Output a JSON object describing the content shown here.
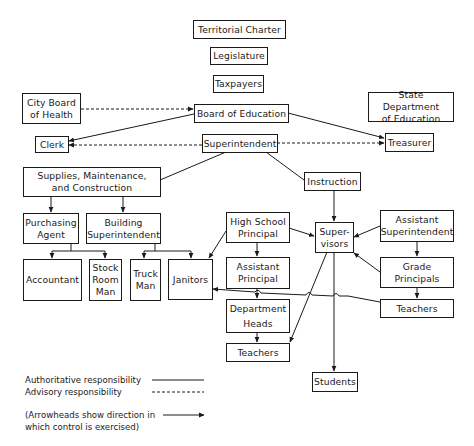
{
  "diagram": {
    "type": "organizational-chart",
    "nodes": {
      "territorial_charter": "Territorial Charter",
      "legislature": "Legislature",
      "taxpayers": "Taxpayers",
      "city_board_of_health": "City Board\nof Health",
      "board_of_education": "Board of Education",
      "state_department_of_education": "State Department\nof Education",
      "clerk": "Clerk",
      "superintendent": "Superintendent",
      "treasurer": "Treasurer",
      "supplies": "Supplies, Maintenance,\nand Construction",
      "instruction": "Instruction",
      "purchasing_agent": "Purchasing\nAgent",
      "building_superintendent": "Building\nSuperintendent",
      "high_school_principal": "High School\nPrincipal",
      "supervisors": "Super-\nvisors",
      "assistant_superintendent": "Assistant\nSuperintendent",
      "accountant": "Accountant",
      "stock_room_man": "Stock\nRoom\nMan",
      "truck_man": "Truck\nMan",
      "janitors": "Janitors",
      "assistant_principal": "Assistant\nPrincipal",
      "grade_principals": "Grade\nPrincipals",
      "department_heads": "Department\nHeads",
      "teachers_elementary": "Teachers",
      "teachers_high_school": "Teachers",
      "students": "Students"
    },
    "edges": [
      {
        "from": "city_board_of_health",
        "to": "board_of_education",
        "style": "advisory"
      },
      {
        "from": "board_of_education",
        "to": "clerk",
        "style": "authoritative"
      },
      {
        "from": "board_of_education",
        "to": "treasurer",
        "style": "authoritative"
      },
      {
        "from": "superintendent",
        "to": "clerk",
        "style": "advisory"
      },
      {
        "from": "superintendent",
        "to": "treasurer",
        "style": "advisory"
      },
      {
        "from": "superintendent",
        "to": "supplies",
        "style": "authoritative"
      },
      {
        "from": "superintendent",
        "to": "instruction",
        "style": "authoritative"
      },
      {
        "from": "supplies",
        "to": "purchasing_agent",
        "style": "authoritative"
      },
      {
        "from": "supplies",
        "to": "building_superintendent",
        "style": "authoritative"
      },
      {
        "from": "purchasing_agent",
        "to": "accountant",
        "style": "authoritative"
      },
      {
        "from": "purchasing_agent",
        "to": "stock_room_man",
        "style": "authoritative"
      },
      {
        "from": "building_superintendent",
        "to": "truck_man",
        "style": "authoritative"
      },
      {
        "from": "building_superintendent",
        "to": "janitors",
        "style": "authoritative"
      },
      {
        "from": "high_school_principal",
        "to": "janitors",
        "style": "authoritative"
      },
      {
        "from": "high_school_principal",
        "to": "supervisors",
        "style": "authoritative"
      },
      {
        "from": "high_school_principal",
        "to": "assistant_principal",
        "style": "authoritative"
      },
      {
        "from": "instruction",
        "to": "supervisors",
        "style": "authoritative"
      },
      {
        "from": "assistant_superintendent",
        "to": "supervisors",
        "style": "authoritative"
      },
      {
        "from": "assistant_superintendent",
        "to": "grade_principals",
        "style": "authoritative"
      },
      {
        "from": "grade_principals",
        "to": "supervisors",
        "style": "authoritative"
      },
      {
        "from": "grade_principals",
        "to": "teachers_elementary",
        "style": "authoritative"
      },
      {
        "from": "teachers_elementary",
        "to": "janitors",
        "style": "authoritative"
      },
      {
        "from": "assistant_principal",
        "to": "department_heads",
        "style": "authoritative"
      },
      {
        "from": "department_heads",
        "to": "teachers_high_school",
        "style": "authoritative"
      },
      {
        "from": "supervisors",
        "to": "teachers_high_school",
        "style": "authoritative"
      },
      {
        "from": "supervisors",
        "to": "students",
        "style": "authoritative"
      }
    ]
  },
  "legend": {
    "authoritative": "Authoritative responsibility",
    "advisory": "Advisory responsibility",
    "arrow_note": "(Arrowheads show direction in\n which control is exercised)"
  },
  "colors": {
    "line": "#1a1a1a",
    "background": "#ffffff"
  }
}
